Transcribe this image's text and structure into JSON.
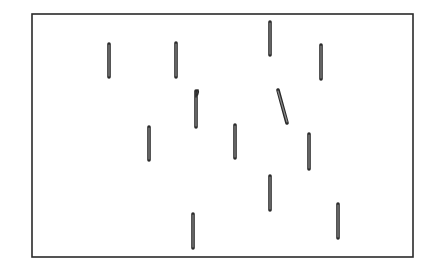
{
  "diagram": {
    "colors": {
      "background": "#ffffff",
      "stroke": "#2a2a2a",
      "rod_fill": "#8a8a8a"
    },
    "frame": {
      "x1": 32,
      "y1": 14,
      "x2": 413,
      "y2": 257
    },
    "rods": [
      {
        "id": 1,
        "x1": 109,
        "y1": 44,
        "x2": 109,
        "y2": 77,
        "shape": "straight"
      },
      {
        "id": 2,
        "x1": 176,
        "y1": 43,
        "x2": 176,
        "y2": 77,
        "shape": "straight"
      },
      {
        "id": 3,
        "x1": 270,
        "y1": 22,
        "x2": 270,
        "y2": 55,
        "shape": "straight"
      },
      {
        "id": 4,
        "x1": 321,
        "y1": 45,
        "x2": 321,
        "y2": 79,
        "shape": "straight"
      },
      {
        "id": 5,
        "x1": 196,
        "y1": 91,
        "x2": 196,
        "y2": 127,
        "shape": "hooked"
      },
      {
        "id": 6,
        "x1": 278,
        "y1": 90,
        "x2": 287,
        "y2": 123,
        "shape": "straight"
      },
      {
        "id": 7,
        "x1": 149,
        "y1": 127,
        "x2": 149,
        "y2": 160,
        "shape": "straight"
      },
      {
        "id": 8,
        "x1": 235,
        "y1": 125,
        "x2": 235,
        "y2": 158,
        "shape": "straight"
      },
      {
        "id": 9,
        "x1": 309,
        "y1": 134,
        "x2": 309,
        "y2": 169,
        "shape": "straight"
      },
      {
        "id": 10,
        "x1": 270,
        "y1": 176,
        "x2": 270,
        "y2": 210,
        "shape": "straight"
      },
      {
        "id": 11,
        "x1": 193,
        "y1": 214,
        "x2": 193,
        "y2": 248,
        "shape": "straight"
      },
      {
        "id": 12,
        "x1": 338,
        "y1": 204,
        "x2": 338,
        "y2": 238,
        "shape": "straight"
      }
    ]
  }
}
